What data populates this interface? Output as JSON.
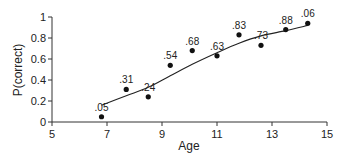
{
  "chart_data": {
    "type": "scatter",
    "title": "",
    "xlabel": "Age",
    "ylabel": "P(correct)",
    "xlim": [
      5,
      15
    ],
    "ylim": [
      0,
      1
    ],
    "grid": false,
    "legend": null,
    "x_ticks": [
      "5",
      "7",
      "9",
      "11",
      "13",
      "15"
    ],
    "y_ticks": [
      "0",
      "0.2",
      "0.4",
      "0.6",
      "0.8",
      "1"
    ],
    "points": [
      {
        "x": 6.8,
        "y": 0.05,
        "label": ".05"
      },
      {
        "x": 7.7,
        "y": 0.31,
        "label": ".31"
      },
      {
        "x": 8.5,
        "y": 0.24,
        "label": ".24"
      },
      {
        "x": 9.3,
        "y": 0.54,
        "label": ".54"
      },
      {
        "x": 10.1,
        "y": 0.68,
        "label": ".68"
      },
      {
        "x": 11.0,
        "y": 0.63,
        "label": ".63"
      },
      {
        "x": 11.8,
        "y": 0.83,
        "label": ".83"
      },
      {
        "x": 12.6,
        "y": 0.73,
        "label": ".73"
      },
      {
        "x": 13.5,
        "y": 0.88,
        "label": ".88"
      },
      {
        "x": 14.3,
        "y": 0.94,
        "label": ".06"
      }
    ],
    "fit_curve": {
      "type": "smooth",
      "x": [
        6.8,
        7.7,
        8.5,
        9.3,
        10.1,
        11.0,
        11.8,
        12.6,
        13.5,
        14.3
      ],
      "y": [
        0.16,
        0.25,
        0.33,
        0.44,
        0.55,
        0.66,
        0.75,
        0.82,
        0.87,
        0.92
      ]
    }
  }
}
